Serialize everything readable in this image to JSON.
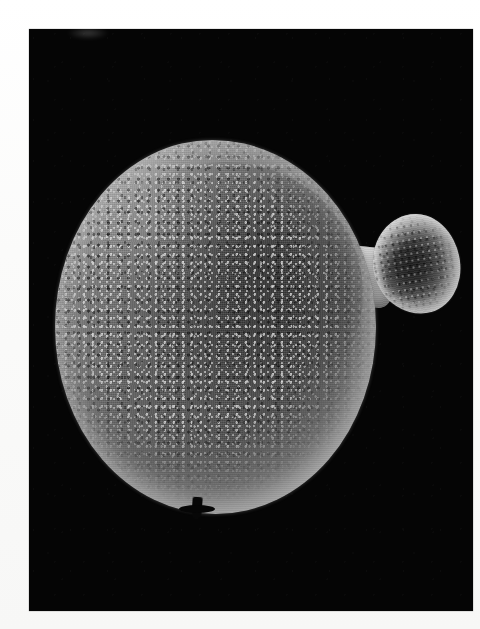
{
  "page": {
    "background_color": "#fdfdfd",
    "width": 480,
    "height": 629,
    "caption": ""
  },
  "plate": {
    "background_color": "#050505",
    "left": 29,
    "top": 29,
    "width": 444,
    "height": 582,
    "label": ""
  },
  "specimen": {
    "kind": "budding-yeast-cell",
    "description": "",
    "mother_cell": {
      "label": "",
      "rim_color": "#c8c8c8",
      "core_color": "#1a1a1a",
      "mid_color": "#575757"
    },
    "neck": {
      "label": "",
      "color": "#b0b0b0"
    },
    "bud": {
      "label": "",
      "rim_color": "#d4d4d4",
      "core_color": "#2b2b2b"
    },
    "debris": {
      "label": "",
      "color": "#070707"
    }
  }
}
